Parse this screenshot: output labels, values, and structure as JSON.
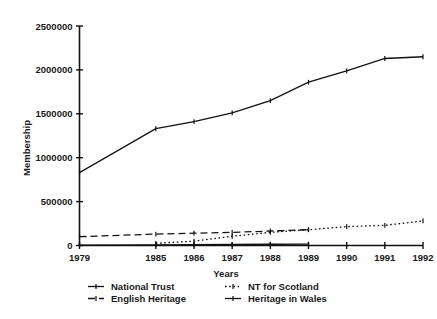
{
  "chart_data": {
    "type": "line",
    "title": "",
    "xlabel": "Years",
    "ylabel": "Membership",
    "x": [
      1979,
      1985,
      1986,
      1987,
      1988,
      1989,
      1990,
      1991,
      1992
    ],
    "xtick_labels": [
      "1979",
      "1985",
      "1986",
      "1987",
      "1988",
      "1989",
      "1990",
      "1991",
      "1992"
    ],
    "ytick_labels": [
      "0",
      "500000",
      "1000000",
      "1500000",
      "2000000",
      "2500000"
    ],
    "ytick_values": [
      0,
      500000,
      1000000,
      1500000,
      2000000,
      2500000
    ],
    "ylim": [
      0,
      2500000
    ],
    "xlim": [
      1979,
      1992
    ],
    "grid": false,
    "legend_position": "bottom",
    "series": [
      {
        "name": "National Trust",
        "line_style": "solid",
        "marker": "dot",
        "x": [
          1979,
          1985,
          1986,
          1987,
          1988,
          1989,
          1990,
          1991,
          1992
        ],
        "values": [
          830000,
          1330000,
          1410000,
          1510000,
          1650000,
          1860000,
          1990000,
          2130000,
          2150000
        ]
      },
      {
        "name": "NT for Scotland",
        "line_style": "dotted",
        "marker": "dot",
        "x": [
          1985,
          1986,
          1987,
          1988,
          1989,
          1990,
          1991,
          1992
        ],
        "values": [
          25000,
          50000,
          105000,
          150000,
          180000,
          215000,
          230000,
          280000
        ]
      },
      {
        "name": "English Heritage",
        "line_style": "dashed",
        "marker": "dot",
        "x": [
          1979,
          1985,
          1986,
          1987,
          1988,
          1989
        ],
        "values": [
          100000,
          130000,
          140000,
          150000,
          165000,
          180000
        ]
      },
      {
        "name": "Heritage in Wales",
        "line_style": "solid",
        "marker": "dot",
        "x": [
          1979,
          1985,
          1986,
          1987,
          1988,
          1989
        ],
        "values": [
          5000,
          8000,
          10000,
          12000,
          14000,
          16000
        ]
      }
    ]
  },
  "legend": {
    "entries": [
      {
        "label": "National Trust",
        "style": "solid"
      },
      {
        "label": "NT for Scotland",
        "style": "dotted"
      },
      {
        "label": "English Heritage",
        "style": "dashed"
      },
      {
        "label": "Heritage in Wales",
        "style": "solid"
      }
    ]
  },
  "colors": {
    "ink": "#111111",
    "background": "#ffffff"
  }
}
